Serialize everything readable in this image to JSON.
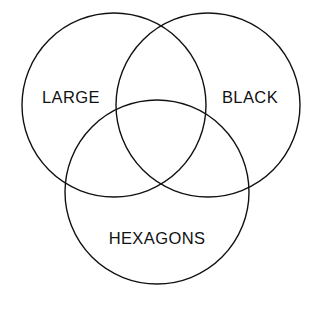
{
  "diagram": {
    "type": "venn",
    "title": "",
    "background_color": "#ffffff",
    "stroke_color": "#111111",
    "label_color": "#111111",
    "sets": [
      {
        "id": "large",
        "label": "LARGE",
        "circle": {
          "cx": 114,
          "cy": 105,
          "r": 92
        },
        "label_position": {
          "x": 71,
          "y": 99
        }
      },
      {
        "id": "black",
        "label": "BLACK",
        "circle": {
          "cx": 208,
          "cy": 105,
          "r": 92
        },
        "label_position": {
          "x": 250,
          "y": 99
        }
      },
      {
        "id": "hexagons",
        "label": "HEXAGONS",
        "circle": {
          "cx": 157,
          "cy": 192,
          "r": 92
        },
        "label_position": {
          "x": 157,
          "y": 240
        }
      }
    ]
  }
}
